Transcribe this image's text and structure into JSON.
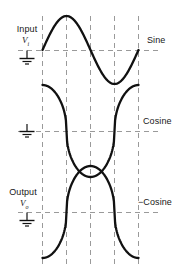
{
  "figure": {
    "background": "#ffffff",
    "trace_color": "#111111",
    "grid_color": "#9a9a9a",
    "grid": {
      "style": "dashed",
      "vertical_lines_x": [
        42,
        66,
        90,
        114,
        138
      ],
      "horizontal_baselines_y": [
        50,
        131,
        212
      ],
      "top": 16,
      "bottom": 264
    }
  },
  "labels": {
    "input_name": "Input",
    "input_symbol": "V",
    "input_subscript": "i",
    "output_name": "Output",
    "output_symbol": "V",
    "output_subscript": "o",
    "trace1_right": "Sine",
    "trace2_right": "Cosine",
    "trace3_right": "−Cosine"
  },
  "ground_symbols": [
    {
      "name": "ground-input",
      "x": 27,
      "y": 64
    },
    {
      "name": "ground-middle",
      "x": 27,
      "y": 136
    },
    {
      "name": "ground-output",
      "x": 27,
      "y": 226
    }
  ],
  "chart_data": {
    "type": "line",
    "xlabel": "",
    "ylabel": "",
    "grid": true,
    "legend_position": "right",
    "x_range": [
      0,
      1
    ],
    "y_range": [
      -1,
      1
    ],
    "series": [
      {
        "name": "Sine",
        "label_right": "Sine",
        "baseline_y": 50,
        "amplitude_px": 34,
        "shape": "sine, one full cycle, positive half first",
        "x": [
          0.0,
          0.05,
          0.1,
          0.15,
          0.2,
          0.25,
          0.3,
          0.35,
          0.4,
          0.45,
          0.5,
          0.55,
          0.6,
          0.65,
          0.7,
          0.75,
          0.8,
          0.85,
          0.9,
          0.95,
          1.0
        ],
        "values": [
          0.0,
          0.31,
          0.59,
          0.81,
          0.95,
          1.0,
          0.95,
          0.81,
          0.59,
          0.31,
          0.0,
          -0.31,
          -0.59,
          -0.81,
          -0.95,
          -1.0,
          -0.95,
          -0.81,
          -0.59,
          -0.31,
          0.0
        ]
      },
      {
        "name": "Cosine",
        "label_right": "Cosine",
        "baseline_y": 131,
        "amplitude_px": 46,
        "shape": "cosine, one full cycle, flattened/clipped extrema",
        "x": [
          0.0,
          0.05,
          0.1,
          0.15,
          0.2,
          0.25,
          0.3,
          0.35,
          0.4,
          0.45,
          0.5,
          0.55,
          0.6,
          0.65,
          0.7,
          0.75,
          0.8,
          0.85,
          0.9,
          0.95,
          1.0
        ],
        "values": [
          1.0,
          0.95,
          0.81,
          0.59,
          0.31,
          0.0,
          -0.31,
          -0.59,
          -0.81,
          -0.95,
          -1.0,
          -0.95,
          -0.81,
          -0.59,
          -0.31,
          0.0,
          0.31,
          0.59,
          0.81,
          0.95,
          1.0
        ]
      },
      {
        "name": "-Cosine",
        "label_right": "−Cosine",
        "baseline_y": 212,
        "amplitude_px": 46,
        "shape": "negative cosine, one full cycle, flattened/clipped extrema",
        "x": [
          0.0,
          0.05,
          0.1,
          0.15,
          0.2,
          0.25,
          0.3,
          0.35,
          0.4,
          0.45,
          0.5,
          0.55,
          0.6,
          0.65,
          0.7,
          0.75,
          0.8,
          0.85,
          0.9,
          0.95,
          1.0
        ],
        "values": [
          -1.0,
          -0.95,
          -0.81,
          -0.59,
          -0.31,
          0.0,
          0.31,
          0.59,
          0.81,
          0.95,
          1.0,
          0.95,
          0.81,
          0.59,
          0.31,
          0.0,
          -0.31,
          -0.59,
          -0.81,
          -0.95,
          -1.0
        ]
      }
    ]
  }
}
